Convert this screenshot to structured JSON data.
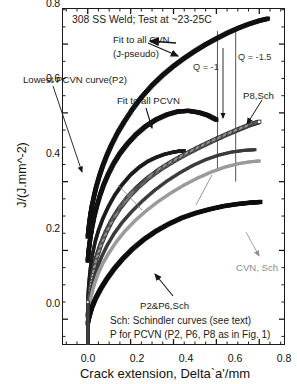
{
  "chart_data": {
    "type": "line",
    "title": "308 SS Weld; Test at ~23-25C",
    "xlabel": "Crack extension, Delta`a'/mm",
    "ylabel": "J/(J.mm^-2)",
    "xlim": [
      -0.12,
      0.92
    ],
    "ylim": [
      -0.075,
      0.905
    ],
    "xticks": [
      0.0,
      0.2,
      0.4,
      0.6,
      0.8
    ],
    "yticks": [
      0.0,
      0.2,
      0.4,
      0.6,
      0.8
    ],
    "xticklabels": [
      "0.0",
      "0.2",
      "0.4",
      "0.6",
      "0.8"
    ],
    "yticklabels": [
      "0.0",
      "0.2",
      "0.4",
      "0.6",
      "0.8"
    ],
    "minor_ticks": true,
    "grid": false,
    "legend": "none (curves labelled by leader-line annotations)",
    "series": [
      {
        "name": "Fit to all CVN (J-pseudo)",
        "marker": "filled-square-thick",
        "color": "#111111",
        "x": [
          0.0,
          0.005,
          0.01,
          0.015,
          0.02,
          0.03,
          0.04,
          0.055,
          0.07,
          0.09,
          0.11,
          0.14,
          0.17,
          0.21,
          0.25,
          0.3,
          0.35,
          0.4,
          0.45,
          0.5,
          0.55,
          0.6,
          0.65,
          0.7,
          0.75,
          0.8,
          0.84
        ],
        "y": [
          0.24,
          0.268,
          0.292,
          0.312,
          0.33,
          0.36,
          0.386,
          0.418,
          0.446,
          0.478,
          0.506,
          0.543,
          0.574,
          0.612,
          0.645,
          0.68,
          0.71,
          0.736,
          0.759,
          0.78,
          0.799,
          0.816,
          0.832,
          0.846,
          0.858,
          0.868,
          0.874
        ]
      },
      {
        "name": "Lowest PCVN curve(P2)",
        "marker": "filled-square-thick",
        "color": "#111111",
        "x": [
          0.0,
          0.004,
          0.008,
          0.014,
          0.02,
          0.03,
          0.042,
          0.058,
          0.075,
          0.095,
          0.12,
          0.15,
          0.185,
          0.225,
          0.27,
          0.32,
          0.37,
          0.42,
          0.47,
          0.52,
          0.56,
          0.6
        ],
        "y": [
          0.17,
          0.196,
          0.218,
          0.245,
          0.266,
          0.298,
          0.328,
          0.362,
          0.392,
          0.421,
          0.452,
          0.482,
          0.51,
          0.537,
          0.561,
          0.581,
          0.595,
          0.604,
          0.606,
          0.601,
          0.593,
          0.58
        ]
      },
      {
        "name": "Fit to all PCVN",
        "marker": "filled-square",
        "color": "#1c1c1c",
        "x": [
          0.0,
          0.005,
          0.012,
          0.022,
          0.035,
          0.05,
          0.07,
          0.095,
          0.125,
          0.16,
          0.2,
          0.24,
          0.28,
          0.32,
          0.36,
          0.4,
          0.43,
          0.45
        ],
        "y": [
          0.06,
          0.105,
          0.148,
          0.188,
          0.226,
          0.258,
          0.292,
          0.326,
          0.36,
          0.391,
          0.42,
          0.442,
          0.459,
          0.471,
          0.48,
          0.486,
          0.489,
          0.49
        ]
      },
      {
        "name": "P8,Sch",
        "marker": "open-square",
        "color": "#ffffff",
        "edgecolor": "#2b2b2b",
        "x": [
          0.0,
          0.006,
          0.014,
          0.026,
          0.04,
          0.06,
          0.085,
          0.115,
          0.15,
          0.19,
          0.235,
          0.285,
          0.34,
          0.4,
          0.46,
          0.52,
          0.58,
          0.64,
          0.7,
          0.76,
          0.8
        ],
        "y": [
          0.01,
          0.052,
          0.095,
          0.14,
          0.178,
          0.216,
          0.253,
          0.29,
          0.324,
          0.356,
          0.385,
          0.412,
          0.437,
          0.46,
          0.481,
          0.5,
          0.518,
          0.535,
          0.551,
          0.566,
          0.574
        ]
      },
      {
        "name": "PCVN Schindler upper",
        "marker": "filled-square-dark",
        "color": "#3a3a3a",
        "x": [
          0.0,
          0.006,
          0.015,
          0.028,
          0.045,
          0.065,
          0.09,
          0.122,
          0.16,
          0.205,
          0.255,
          0.31,
          0.37,
          0.43,
          0.49,
          0.55,
          0.61,
          0.67,
          0.73,
          0.78
        ],
        "y": [
          0.005,
          0.04,
          0.078,
          0.115,
          0.15,
          0.182,
          0.214,
          0.248,
          0.281,
          0.313,
          0.344,
          0.374,
          0.402,
          0.426,
          0.447,
          0.464,
          0.477,
          0.486,
          0.491,
          0.493
        ]
      },
      {
        "name": "CVN, Sch",
        "marker": "filled-square-gray",
        "color": "#9a9a9a",
        "x": [
          0.0,
          0.006,
          0.016,
          0.03,
          0.048,
          0.07,
          0.098,
          0.132,
          0.172,
          0.218,
          0.27,
          0.328,
          0.39,
          0.452,
          0.514,
          0.576,
          0.638,
          0.7,
          0.76,
          0.8
        ],
        "y": [
          0.0,
          0.032,
          0.066,
          0.1,
          0.132,
          0.162,
          0.192,
          0.224,
          0.255,
          0.285,
          0.314,
          0.342,
          0.368,
          0.391,
          0.411,
          0.428,
          0.442,
          0.452,
          0.458,
          0.46
        ]
      },
      {
        "name": "P2&P6,Sch",
        "marker": "filled-square-thick",
        "color": "#0d0d0d",
        "x": [
          0.0,
          0.008,
          0.02,
          0.038,
          0.06,
          0.09,
          0.125,
          0.165,
          0.21,
          0.262,
          0.318,
          0.378,
          0.44,
          0.505,
          0.57,
          0.635,
          0.7,
          0.76,
          0.805
        ],
        "y": [
          -0.012,
          0.01,
          0.035,
          0.062,
          0.088,
          0.118,
          0.148,
          0.177,
          0.205,
          0.232,
          0.256,
          0.277,
          0.295,
          0.309,
          0.32,
          0.329,
          0.335,
          0.339,
          0.341
        ]
      },
      {
        "name": "vertical stack at x=0",
        "marker": "open-square-small",
        "color": "#b0b0b0",
        "x": [
          0.0,
          0.0,
          0.0,
          0.0,
          0.0,
          0.0,
          0.0,
          0.0,
          0.0,
          0.0,
          0.0,
          0.0,
          0.0,
          0.0,
          0.0,
          0.0
        ],
        "y": [
          -0.07,
          -0.062,
          -0.054,
          -0.046,
          -0.038,
          -0.03,
          -0.022,
          -0.014,
          -0.006,
          0.002,
          0.01,
          0.018,
          0.026,
          0.034,
          0.042,
          0.05
        ]
      }
    ],
    "reference_lines": [
      {
        "label": "Q = -1",
        "x": 0.605,
        "y_top": 0.838,
        "y_bottom": 0.43,
        "color": "#555555"
      },
      {
        "label": "Q = -1.5",
        "x": 0.69,
        "y_top": 0.838,
        "y_bottom": 0.4,
        "color": "#555555"
      }
    ],
    "annotations": [
      {
        "name": "title",
        "text": "308 SS Weld; Test at ~23-25C"
      },
      {
        "name": "fit-all-cvn-line1",
        "text": "Fit to all CVN"
      },
      {
        "name": "fit-all-cvn-line2",
        "text": "(J-pseudo)"
      },
      {
        "name": "lowest-pcvn",
        "text": "Lowest PCVN curve(P2)"
      },
      {
        "name": "fit-all-pcvn",
        "text": "Fit to all PCVN"
      },
      {
        "name": "q-minus-1",
        "text": "Q = -1"
      },
      {
        "name": "q-minus-1p5",
        "text": "Q = -1.5"
      },
      {
        "name": "p8-sch",
        "text": "P8,Sch"
      },
      {
        "name": "cvn-sch",
        "text": "CVN, Sch"
      },
      {
        "name": "p2-p6-sch",
        "text": "P2&P6,Sch"
      },
      {
        "name": "caption-line1",
        "text": "Sch: Schindler curves (see text)"
      },
      {
        "name": "caption-line2",
        "text": "P for PCVN (P2, P6, P8 as in Fig. 1)"
      }
    ]
  }
}
